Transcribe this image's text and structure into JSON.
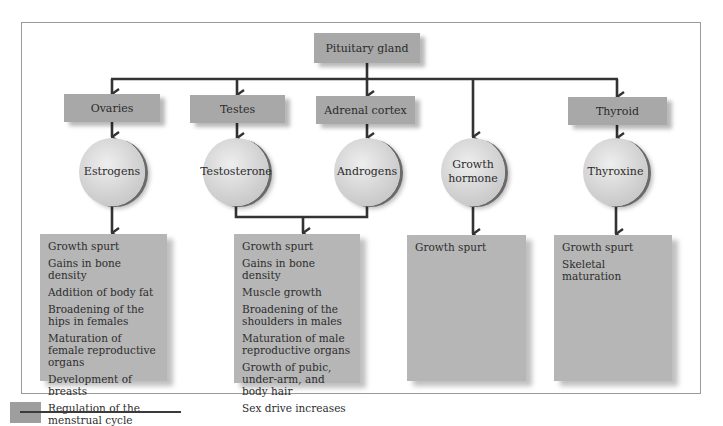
{
  "diagram": {
    "source": {
      "label": "Pituitary gland"
    },
    "glands": [
      {
        "id": "ovaries",
        "label": "Ovaries"
      },
      {
        "id": "testes",
        "label": "Testes"
      },
      {
        "id": "adrenal",
        "label": "Adrenal cortex"
      },
      {
        "id": "thyroid",
        "label": "Thyroid"
      }
    ],
    "hormones": [
      {
        "id": "estrogens",
        "label": "Estrogens"
      },
      {
        "id": "testosterone",
        "label": "Testosterone"
      },
      {
        "id": "androgens",
        "label": "Androgens"
      },
      {
        "id": "growth_hormone",
        "label_line1": "Growth",
        "label_line2": "hormone"
      },
      {
        "id": "thyroxine",
        "label": "Thyroxine"
      }
    ],
    "effects": [
      {
        "id": "estrogen_effects",
        "items": [
          "Growth spurt",
          "Gains in bone density",
          "Addition of body fat",
          "Broadening of the hips in females",
          "Maturation of female reproductive organs",
          "Development of breasts",
          "Regulation of the menstrual cycle"
        ]
      },
      {
        "id": "androgen_effects",
        "items": [
          "Growth spurt",
          "Gains in bone density",
          "Muscle growth",
          "Broadening of the shoulders in males",
          "Maturation of male reproductive organs",
          "Growth of pubic, under-arm, and body hair",
          "Sex drive increases"
        ]
      },
      {
        "id": "growth_hormone_effects",
        "items": [
          "Growth spurt"
        ]
      },
      {
        "id": "thyroxine_effects",
        "items": [
          "Growth spurt",
          "Skeletal maturation"
        ]
      }
    ],
    "colors": {
      "box_fill": "#a8a8a8",
      "effects_fill": "#b6b6b6",
      "circle_fill": "#d2d2d2",
      "line": "#333333",
      "frame": "#9a9a9a"
    }
  }
}
